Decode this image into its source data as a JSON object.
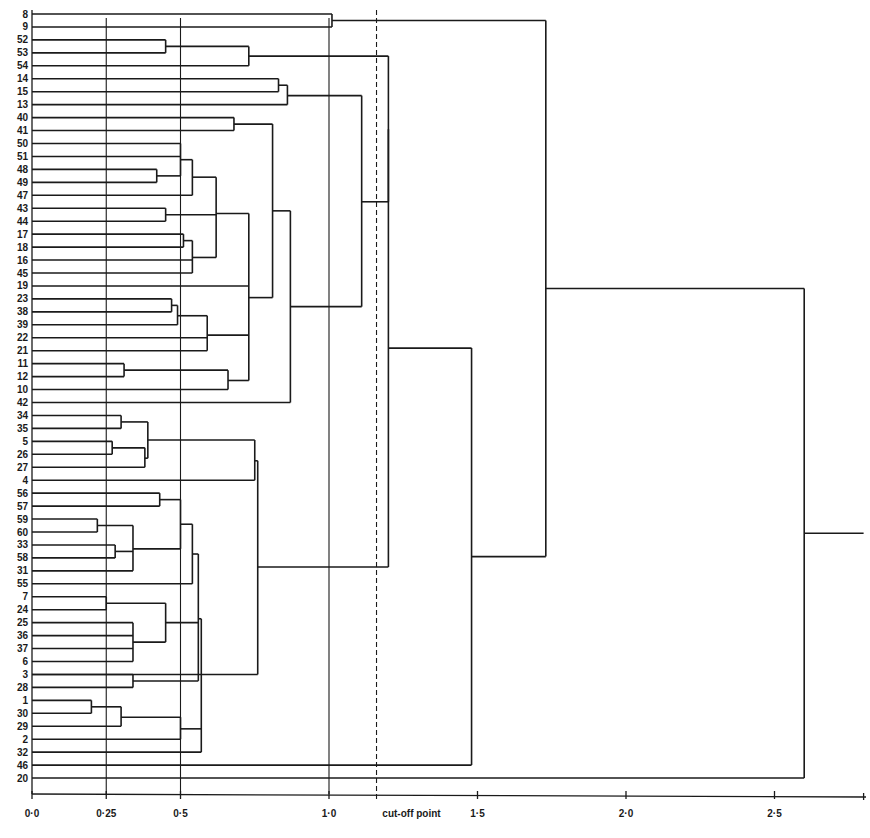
{
  "chart_data": {
    "type": "dendrogram",
    "title": "",
    "xlabel": "",
    "ylabel": "",
    "x_ticks": [
      {
        "value": 0.0,
        "label": "0·0"
      },
      {
        "value": 0.25,
        "label": "0·25"
      },
      {
        "value": 0.5,
        "label": "0·5"
      },
      {
        "value": 1.0,
        "label": "1·0"
      },
      {
        "value": 1.5,
        "label": "1·5"
      },
      {
        "value": 2.0,
        "label": "2·0"
      },
      {
        "value": 2.5,
        "label": "2·5"
      }
    ],
    "xlim": [
      0,
      2.8
    ],
    "vertical_gridlines": [
      0.25,
      0.5,
      1.0
    ],
    "cutoff": {
      "value": 1.16,
      "label": "cut-off point",
      "style": "dashed"
    },
    "leaves": [
      "8",
      "9",
      "52",
      "53",
      "54",
      "14",
      "15",
      "13",
      "40",
      "41",
      "50",
      "51",
      "48",
      "49",
      "47",
      "43",
      "44",
      "17",
      "18",
      "16",
      "45",
      "19",
      "23",
      "38",
      "39",
      "22",
      "21",
      "11",
      "12",
      "10",
      "42",
      "34",
      "35",
      "5",
      "26",
      "27",
      "4",
      "56",
      "57",
      "59",
      "60",
      "33",
      "58",
      "31",
      "55",
      "7",
      "24",
      "25",
      "36",
      "37",
      "6",
      "3",
      "28",
      "1",
      "30",
      "29",
      "2",
      "32",
      "46",
      "20"
    ],
    "merges": [
      {
        "h": 1.01,
        "rows": [
          0,
          1
        ]
      },
      {
        "h": 0.45,
        "rows": [
          2,
          3
        ]
      },
      {
        "h": 0.73,
        "from": [
          2.5,
          4
        ]
      },
      {
        "h": 0.83,
        "rows": [
          5,
          6
        ]
      },
      {
        "h": 0.86,
        "from": [
          5.5,
          7
        ]
      },
      {
        "h": 0.68,
        "rows": [
          8,
          9
        ]
      },
      {
        "h": 0.42,
        "rows": [
          12,
          13
        ]
      },
      {
        "h": 0.5,
        "from": [
          10,
          11,
          12.5
        ]
      },
      {
        "h": 0.54,
        "from": [
          11.25,
          14
        ]
      },
      {
        "h": 0.45,
        "rows": [
          15,
          16
        ]
      },
      {
        "h": 0.51,
        "rows": [
          17,
          18
        ]
      },
      {
        "h": 0.54,
        "from": [
          17.5,
          19,
          20
        ]
      },
      {
        "h": 0.62,
        "from": [
          12.6,
          15.5,
          18.8
        ]
      },
      {
        "h": 0.47,
        "rows": [
          22,
          23
        ]
      },
      {
        "h": 0.49,
        "from": [
          22.5,
          24
        ]
      },
      {
        "h": 0.59,
        "from": [
          23.3,
          25,
          26
        ]
      },
      {
        "h": 0.31,
        "rows": [
          27,
          28
        ]
      },
      {
        "h": 0.66,
        "from": [
          27.5,
          29
        ]
      },
      {
        "h": 0.73,
        "from": [
          15.4,
          21,
          24.8,
          28.3
        ]
      },
      {
        "h": 0.81,
        "from": [
          8.5,
          21.9
        ]
      },
      {
        "h": 0.87,
        "from": [
          15.2,
          30
        ]
      },
      {
        "h": 1.11,
        "from": [
          6.3,
          22.6
        ]
      },
      {
        "h": 1.2,
        "from": [
          3.25,
          14.5
        ]
      },
      {
        "h": 0.3,
        "rows": [
          31,
          32
        ]
      },
      {
        "h": 0.27,
        "rows": [
          33,
          34
        ]
      },
      {
        "h": 0.38,
        "from": [
          33.5,
          35
        ]
      },
      {
        "h": 0.39,
        "from": [
          31.5,
          34.3
        ]
      },
      {
        "h": 0.75,
        "from": [
          32.9,
          36
        ]
      },
      {
        "h": 0.43,
        "rows": [
          37,
          38
        ]
      },
      {
        "h": 0.22,
        "rows": [
          39,
          40
        ]
      },
      {
        "h": 0.28,
        "rows": [
          41,
          42
        ]
      },
      {
        "h": 0.34,
        "from": [
          39.5,
          41.5,
          43
        ]
      },
      {
        "h": 0.5,
        "from": [
          37.5,
          41.3
        ]
      },
      {
        "h": 0.54,
        "from": [
          39.4,
          44
        ]
      },
      {
        "h": 0.25,
        "rows": [
          45,
          46
        ]
      },
      {
        "h": 0.34,
        "rows": [
          47,
          48,
          49,
          50
        ]
      },
      {
        "h": 0.45,
        "from": [
          45.5,
          48.5
        ]
      },
      {
        "h": 0.34,
        "rows": [
          51,
          52
        ]
      },
      {
        "h": 0.56,
        "from": [
          41.7,
          47,
          51.5
        ]
      },
      {
        "h": 0.2,
        "rows": [
          53,
          54
        ]
      },
      {
        "h": 0.3,
        "from": [
          53.5,
          55
        ]
      },
      {
        "h": 0.5,
        "from": [
          54.3,
          56
        ]
      },
      {
        "h": 0.57,
        "from": [
          46.7,
          55.2,
          57
        ]
      },
      {
        "h": 0.76,
        "from": [
          34.5,
          51
        ]
      },
      {
        "h": 1.2,
        "from": [
          8.9,
          42.7
        ]
      },
      {
        "h": 1.48,
        "from": [
          25.8,
          58
        ]
      },
      {
        "h": 1.73,
        "from": [
          0.5,
          41.9
        ]
      },
      {
        "h": 2.6,
        "from": [
          21.2,
          59
        ]
      }
    ],
    "root_tail_to": 2.8
  }
}
